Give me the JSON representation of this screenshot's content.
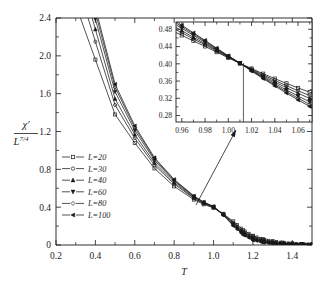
{
  "chart_data": {
    "type": "line",
    "title": "",
    "xlabel": "T",
    "ylabel_numerator": "χ′",
    "ylabel_denominator": "L",
    "ylabel_denominator_exponent": "7/4",
    "xlim": [
      0.2,
      1.5
    ],
    "ylim": [
      0,
      2.4
    ],
    "xticks": [
      0.2,
      0.4,
      0.6,
      0.8,
      1.0,
      1.2,
      1.4
    ],
    "xticklabels": [
      "0.2",
      "0.4",
      "0.6",
      "0.8",
      "1.0",
      "1.2",
      "1.4"
    ],
    "yticks": [
      0,
      0.4,
      0.8,
      1.2,
      1.6,
      2.0,
      2.4
    ],
    "yticklabels": [
      "0",
      "0.4",
      "0.8",
      "1.2",
      "1.6",
      "2.0",
      "2.4"
    ],
    "xminor_step": 0.1,
    "yminor_step": 0.2,
    "grid": false,
    "legend_position": "center-left",
    "legend_entries": [
      {
        "label": "L=20",
        "marker": "square-open"
      },
      {
        "label": "L=30",
        "marker": "circle-open"
      },
      {
        "label": "L=40",
        "marker": "triangle-up-filled"
      },
      {
        "label": "L=60",
        "marker": "triangle-down-filled"
      },
      {
        "label": "L=80",
        "marker": "diamond-open"
      },
      {
        "label": "L=100",
        "marker": "triangle-left-filled"
      }
    ],
    "series": [
      {
        "name": "L=20",
        "marker": "square-open",
        "x": [
          0.4,
          0.5,
          0.6,
          0.7,
          0.8,
          0.9,
          0.95,
          1.0,
          1.05,
          1.1,
          1.15,
          1.2,
          1.25,
          1.3,
          1.35,
          1.4,
          1.45,
          1.5
        ],
        "y": [
          1.96,
          1.38,
          1.08,
          0.81,
          0.62,
          0.48,
          0.43,
          0.392,
          0.33,
          0.25,
          0.16,
          0.098,
          0.062,
          0.04,
          0.026,
          0.017,
          0.011,
          0.008
        ]
      },
      {
        "name": "L=30",
        "marker": "circle-open",
        "x": [
          0.4,
          0.5,
          0.6,
          0.7,
          0.8,
          0.9,
          0.95,
          1.0,
          1.05,
          1.1,
          1.15,
          1.2,
          1.25,
          1.3,
          1.35,
          1.4,
          1.45,
          1.5
        ],
        "y": [
          2.15,
          1.48,
          1.13,
          0.845,
          0.645,
          0.492,
          0.438,
          0.398,
          0.327,
          0.236,
          0.143,
          0.082,
          0.049,
          0.03,
          0.019,
          0.012,
          0.008,
          0.005
        ]
      },
      {
        "name": "L=40",
        "marker": "triangle-up-filled",
        "x": [
          0.4,
          0.5,
          0.6,
          0.7,
          0.8,
          0.9,
          0.95,
          1.0,
          1.05,
          1.1,
          1.15,
          1.2,
          1.25,
          1.3,
          1.35,
          1.4,
          1.45,
          1.5
        ],
        "y": [
          2.28,
          1.545,
          1.168,
          0.868,
          0.66,
          0.5,
          0.443,
          0.401,
          0.324,
          0.226,
          0.132,
          0.072,
          0.041,
          0.024,
          0.015,
          0.009,
          0.006,
          0.004
        ]
      },
      {
        "name": "L=60",
        "marker": "triangle-down-filled",
        "x": [
          0.4,
          0.5,
          0.6,
          0.7,
          0.8,
          0.9,
          0.95,
          1.0,
          1.05,
          1.1,
          1.15,
          1.2,
          1.25,
          1.3,
          1.35,
          1.4,
          1.45,
          1.5
        ],
        "y": [
          2.39,
          1.62,
          1.212,
          0.895,
          0.676,
          0.509,
          0.449,
          0.404,
          0.32,
          0.215,
          0.12,
          0.062,
          0.034,
          0.019,
          0.011,
          0.007,
          0.004,
          0.003
        ]
      },
      {
        "name": "L=80",
        "marker": "diamond-open",
        "x": [
          0.4,
          0.5,
          0.6,
          0.7,
          0.8,
          0.9,
          0.95,
          1.0,
          1.05,
          1.1,
          1.15,
          1.2,
          1.25,
          1.3,
          1.35,
          1.4,
          1.45,
          1.5
        ],
        "y": [
          2.46,
          1.668,
          1.24,
          0.912,
          0.686,
          0.515,
          0.452,
          0.406,
          0.317,
          0.208,
          0.113,
          0.056,
          0.03,
          0.016,
          0.009,
          0.006,
          0.004,
          0.002
        ]
      },
      {
        "name": "L=100",
        "marker": "triangle-left-filled",
        "x": [
          0.4,
          0.5,
          0.6,
          0.7,
          0.8,
          0.9,
          0.95,
          1.0,
          1.05,
          1.1,
          1.15,
          1.2,
          1.25,
          1.3,
          1.35,
          1.4,
          1.45,
          1.5
        ],
        "y": [
          2.51,
          1.7,
          1.26,
          0.924,
          0.693,
          0.519,
          0.454,
          0.407,
          0.315,
          0.203,
          0.108,
          0.052,
          0.027,
          0.014,
          0.008,
          0.005,
          0.003,
          0.002
        ]
      }
    ],
    "annotations": [
      {
        "type": "arrow",
        "description": "arrow from main-curve-bundle to inset"
      }
    ],
    "inset": {
      "type": "line",
      "xlabel": "",
      "ylabel": "",
      "xlim": [
        0.955,
        1.072
      ],
      "ylim": [
        0.265,
        0.497
      ],
      "xticks": [
        0.96,
        0.98,
        1.0,
        1.02,
        1.04,
        1.06
      ],
      "xticklabels": [
        "0.96",
        "0.98",
        "1.00",
        "1.02",
        "1.04",
        "1.06"
      ],
      "yticks": [
        0.28,
        0.32,
        0.36,
        0.4,
        0.44,
        0.48
      ],
      "yticklabels": [
        "0.28",
        "0.32",
        "0.36",
        "0.40",
        "0.44",
        "0.48"
      ],
      "crossing_line_x": 1.013,
      "grid": false,
      "series": [
        {
          "name": "L=20",
          "marker": "square-open",
          "x": [
            0.96,
            0.97,
            0.98,
            0.99,
            1.0,
            1.01,
            1.02,
            1.03,
            1.04,
            1.05,
            1.06,
            1.07
          ],
          "y": [
            0.466,
            0.453,
            0.4405,
            0.427,
            0.414,
            0.401,
            0.389,
            0.377,
            0.3655,
            0.3545,
            0.344,
            0.334
          ]
        },
        {
          "name": "L=30",
          "marker": "circle-open",
          "x": [
            0.96,
            0.97,
            0.98,
            0.99,
            1.0,
            1.01,
            1.02,
            1.03,
            1.04,
            1.05,
            1.06,
            1.07
          ],
          "y": [
            0.472,
            0.4578,
            0.444,
            0.4295,
            0.4152,
            0.4012,
            0.3875,
            0.3742,
            0.3615,
            0.3492,
            0.3375,
            0.3262
          ]
        },
        {
          "name": "L=40",
          "marker": "triangle-up-filled",
          "x": [
            0.96,
            0.97,
            0.98,
            0.99,
            1.0,
            1.01,
            1.02,
            1.03,
            1.04,
            1.05,
            1.06,
            1.07
          ],
          "y": [
            0.4768,
            0.4615,
            0.4468,
            0.4313,
            0.416,
            0.4014,
            0.3862,
            0.3718,
            0.3578,
            0.3445,
            0.3318,
            0.3195
          ]
        },
        {
          "name": "L=60",
          "marker": "triangle-down-filled",
          "x": [
            0.96,
            0.97,
            0.98,
            0.99,
            1.0,
            1.01,
            1.02,
            1.03,
            1.04,
            1.05,
            1.06,
            1.07
          ],
          "y": [
            0.4822,
            0.466,
            0.45,
            0.4335,
            0.4172,
            0.4016,
            0.3848,
            0.3692,
            0.354,
            0.3392,
            0.3252,
            0.3118
          ]
        },
        {
          "name": "L=80",
          "marker": "diamond-open",
          "x": [
            0.96,
            0.97,
            0.98,
            0.99,
            1.0,
            1.01,
            1.02,
            1.03,
            1.04,
            1.05,
            1.06,
            1.07
          ],
          "y": [
            0.4862,
            0.4692,
            0.4525,
            0.435,
            0.418,
            0.4017,
            0.3838,
            0.3672,
            0.351,
            0.3352,
            0.3202,
            0.3058
          ]
        },
        {
          "name": "L=100",
          "marker": "triangle-left-filled",
          "x": [
            0.96,
            0.97,
            0.98,
            0.99,
            1.0,
            1.01,
            1.02,
            1.03,
            1.04,
            1.05,
            1.06,
            1.07
          ],
          "y": [
            0.4895,
            0.4718,
            0.4545,
            0.4362,
            0.4186,
            0.4018,
            0.383,
            0.3656,
            0.3486,
            0.332,
            0.3162,
            0.301
          ]
        }
      ]
    }
  }
}
